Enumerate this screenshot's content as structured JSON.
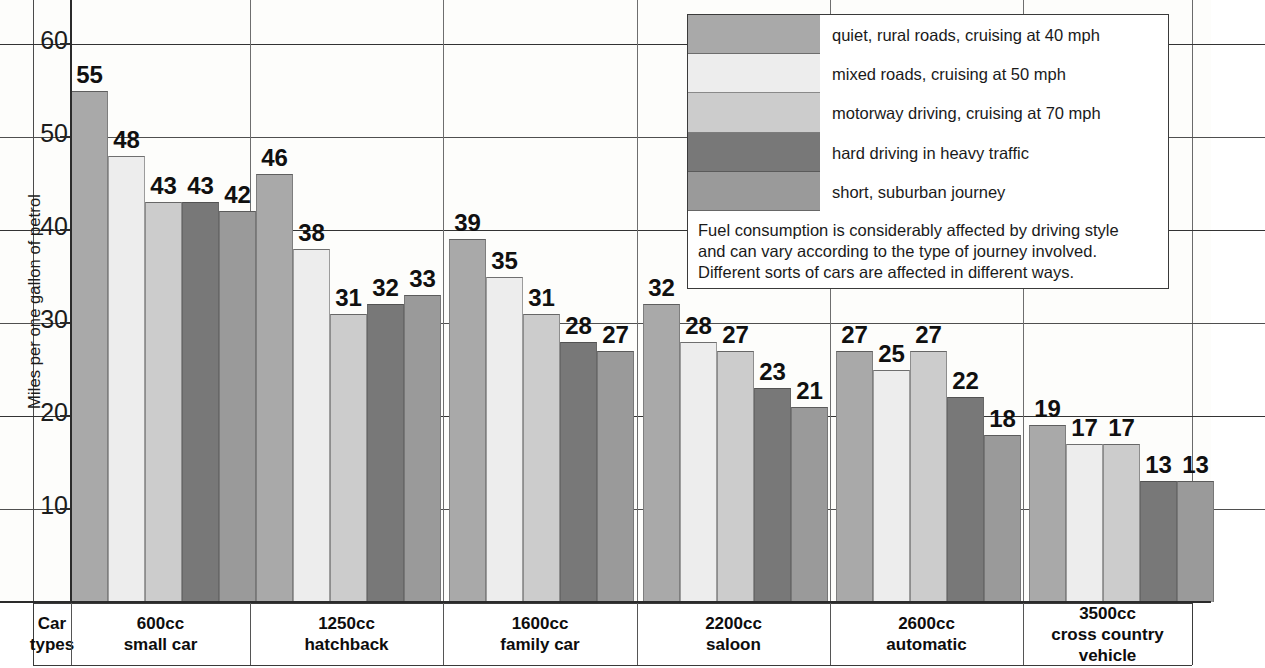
{
  "chart_data": {
    "type": "bar",
    "title": "",
    "xlabel": "Car types",
    "ylabel": "Miles per one gallon of petrol",
    "ylim": [
      0,
      65
    ],
    "yticks": [
      10,
      20,
      30,
      40,
      50,
      60
    ],
    "grid": true,
    "legend_position": "top-right",
    "categories": [
      "600cc small car",
      "1250cc hatchback",
      "1600cc family car",
      "2200cc saloon",
      "2600cc automatic",
      "3500cc cross country vehicle"
    ],
    "series": [
      {
        "name": "quiet, rural roads, cruising at 40 mph",
        "color": "#a9a9a9",
        "values": [
          55,
          46,
          39,
          32,
          27,
          19
        ]
      },
      {
        "name": "mixed roads, cruising at 50 mph",
        "color": "#ededed",
        "values": [
          48,
          38,
          35,
          28,
          25,
          17
        ]
      },
      {
        "name": "motorway driving, cruising at 70 mph",
        "color": "#cccccc",
        "values": [
          43,
          31,
          31,
          27,
          27,
          17
        ]
      },
      {
        "name": "hard driving in heavy traffic",
        "color": "#787878",
        "values": [
          43,
          32,
          28,
          23,
          22,
          13
        ]
      },
      {
        "name": "short, suburban journey",
        "color": "#9a9a9a",
        "values": [
          42,
          33,
          27,
          21,
          18,
          13
        ]
      }
    ],
    "annotation": "Fuel consumption is considerably affected by driving style and can vary according to the type of journey involved. Different sorts of cars are affected in different ways."
  },
  "yaxis": {
    "label": "Miles per one gallon of petrol",
    "ticks": [
      "60",
      "50",
      "40",
      "30",
      "20",
      "10"
    ]
  },
  "legend": {
    "items": [
      {
        "label": "quiet, rural roads, cruising at 40 mph",
        "color": "#a9a9a9"
      },
      {
        "label": "mixed roads, cruising at 50 mph",
        "color": "#ededed"
      },
      {
        "label": "motorway driving, cruising at 70 mph",
        "color": "#cccccc"
      },
      {
        "label": "hard driving in heavy traffic",
        "color": "#787878"
      },
      {
        "label": "short, suburban journey",
        "color": "#9a9a9a"
      }
    ],
    "note_lines": [
      "Fuel consumption is considerably affected by driving style",
      "and can vary according to the type of journey involved.",
      "Different sorts of cars are affected in different ways."
    ]
  },
  "categories_strip": {
    "axis_label_line1": "Car",
    "axis_label_line2": "types",
    "cells": [
      {
        "line1": "600cc",
        "line2": "small car"
      },
      {
        "line1": "1250cc",
        "line2": "hatchback"
      },
      {
        "line1": "1600cc",
        "line2": "family car"
      },
      {
        "line1": "2200cc",
        "line2": "saloon"
      },
      {
        "line1": "2600cc",
        "line2": "automatic"
      },
      {
        "line1": "3500cc",
        "line2": "cross country vehicle"
      }
    ]
  }
}
